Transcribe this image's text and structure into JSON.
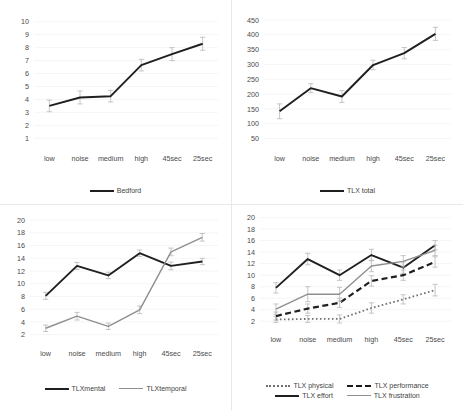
{
  "figure": {
    "categories": [
      "low",
      "noise",
      "medium",
      "high",
      "45sec",
      "25sec"
    ],
    "colors": {
      "dark": "#1f1f1f",
      "gray": "#8f8f8f",
      "dotted": "#6f6f6f",
      "gridline": "#efefef",
      "panel_border": "#e8e8e8",
      "tick_text": "#4a4a4a"
    }
  },
  "chart_data": [
    {
      "id": "bedford",
      "type": "line",
      "title": "",
      "xlabel": "",
      "ylabel": "",
      "categories": [
        "low",
        "noise",
        "medium",
        "high",
        "45sec",
        "25sec"
      ],
      "yticks": [
        1,
        2,
        3,
        4,
        5,
        6,
        7,
        8,
        9,
        10
      ],
      "ylim": [
        0.4,
        10.6
      ],
      "grid": false,
      "legend_position": "bottom",
      "series": [
        {
          "name": "Bedford",
          "style": "solid-dark",
          "values": [
            3.5,
            4.15,
            4.25,
            6.65,
            7.5,
            8.3
          ],
          "errors": [
            0.45,
            0.5,
            0.45,
            0.45,
            0.5,
            0.5
          ]
        }
      ]
    },
    {
      "id": "tlx-total",
      "type": "line",
      "title": "",
      "xlabel": "",
      "ylabel": "",
      "categories": [
        "low",
        "noise",
        "medium",
        "high",
        "45sec",
        "25sec"
      ],
      "yticks": [
        50,
        100,
        150,
        200,
        250,
        300,
        350,
        400,
        450
      ],
      "ylim": [
        25,
        470
      ],
      "grid": false,
      "legend_position": "bottom",
      "series": [
        {
          "name": "TLX total",
          "style": "solid-dark",
          "values": [
            142,
            220,
            192,
            298,
            338,
            403
          ],
          "errors": [
            25,
            15,
            20,
            16,
            19,
            22
          ]
        }
      ]
    },
    {
      "id": "tlx-mental-temporal",
      "type": "line",
      "title": "",
      "xlabel": "",
      "ylabel": "",
      "categories": [
        "low",
        "noise",
        "medium",
        "high",
        "45sec",
        "25sec"
      ],
      "yticks": [
        2,
        4,
        6,
        8,
        10,
        12,
        14,
        16,
        18,
        20
      ],
      "ylim": [
        1.0,
        20.8
      ],
      "grid": false,
      "legend_position": "bottom",
      "series": [
        {
          "name": "TLXmental",
          "style": "solid-dark",
          "values": [
            8.1,
            12.8,
            11.3,
            14.8,
            12.8,
            13.5
          ],
          "errors": [
            0.55,
            0.55,
            0.5,
            0.5,
            0.6,
            0.5
          ]
        },
        {
          "name": "TLXtemporal",
          "style": "solid-gray",
          "values": [
            3.0,
            4.9,
            3.3,
            5.9,
            15.0,
            17.3
          ],
          "errors": [
            0.5,
            0.6,
            0.5,
            0.6,
            0.6,
            0.6
          ]
        }
      ]
    },
    {
      "id": "tlx-subscales",
      "type": "line",
      "title": "",
      "xlabel": "",
      "ylabel": "",
      "categories": [
        "low",
        "noise",
        "medium",
        "high",
        "45sec",
        "25sec"
      ],
      "yticks": [
        2,
        4,
        6,
        8,
        10,
        12,
        14,
        16,
        18,
        20
      ],
      "ylim": [
        1.0,
        20.8
      ],
      "grid": false,
      "legend_position": "bottom",
      "series": [
        {
          "name": "TLX physical",
          "style": "dotted",
          "values": [
            2.3,
            2.4,
            2.4,
            4.3,
            5.8,
            7.4
          ],
          "errors": [
            0.5,
            0.6,
            0.7,
            0.9,
            0.8,
            1.0
          ]
        },
        {
          "name": "TLX performance",
          "style": "dashed",
          "values": [
            2.9,
            4.2,
            5.2,
            9.0,
            10.0,
            12.3
          ],
          "errors": [
            0.7,
            0.8,
            0.8,
            0.9,
            0.9,
            0.9
          ]
        },
        {
          "name": "TLX effort",
          "style": "solid-dark",
          "values": [
            7.8,
            12.8,
            10.0,
            13.5,
            11.3,
            15.2
          ],
          "errors": [
            0.9,
            1.0,
            0.9,
            1.0,
            1.0,
            0.8
          ]
        },
        {
          "name": "TLX frustration",
          "style": "solid-gray",
          "values": [
            4.1,
            6.7,
            6.7,
            11.6,
            12.4,
            14.3
          ],
          "errors": [
            0.9,
            1.3,
            1.2,
            1.0,
            1.0,
            0.9
          ]
        }
      ]
    }
  ]
}
